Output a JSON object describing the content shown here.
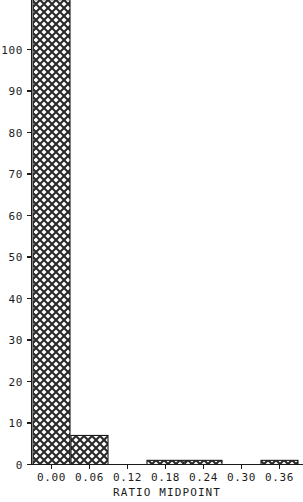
{
  "chart_data": {
    "type": "bar",
    "title": "",
    "xlabel": "RATIO MIDPOINT",
    "ylabel": "",
    "categories": [
      "0.00",
      "0.06",
      "0.12",
      "0.18",
      "0.24",
      "0.30",
      "0.36"
    ],
    "x": [
      0.0,
      0.06,
      0.12,
      0.18,
      0.24,
      0.3,
      0.36
    ],
    "values": [
      112,
      7,
      0,
      1,
      1,
      0,
      1
    ],
    "bin_width": 0.06,
    "xlim": [
      -0.03,
      0.39
    ],
    "ylim": [
      0,
      105
    ],
    "xticks": [
      0.0,
      0.06,
      0.12,
      0.18,
      0.24,
      0.3,
      0.36
    ],
    "xtick_labels": [
      "0.00",
      "0.06",
      "0.12",
      "0.18",
      "0.24",
      "0.30",
      "0.36"
    ],
    "yticks": [
      0,
      10,
      20,
      30,
      40,
      50,
      60,
      70,
      80,
      90,
      100
    ],
    "ytick_labels": [
      "0",
      "10",
      "20",
      "30",
      "40",
      "50",
      "60",
      "70",
      "80",
      "90",
      "100"
    ],
    "grid": false,
    "legend": null,
    "bar_fill": "crosshatch"
  },
  "colors": {
    "ink": "#1a1a1a",
    "background": "#ffffff",
    "hatch": "#2a2a2a"
  }
}
